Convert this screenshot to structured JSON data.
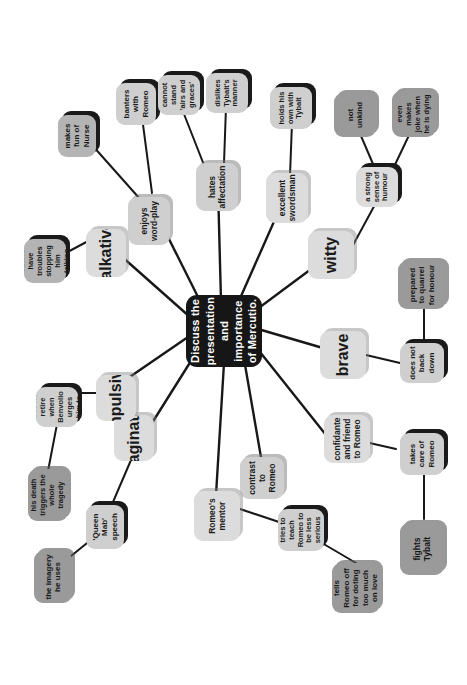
{
  "canvas": {
    "width": 467,
    "height": 685,
    "background": "#ffffff"
  },
  "map": {
    "title": "Mercutio mind map",
    "rotation_degrees": -90,
    "center": {
      "label": "Discuss the presentation and importance of Mercutio.",
      "background": "#161616",
      "text_color": "#ffffff"
    },
    "palette": {
      "dark": "#9a9a9a",
      "mid": "#b4b4b4",
      "light": "#cfcfcf",
      "pale": "#dcdcdc",
      "edge": "#181818",
      "center": "#161616"
    },
    "nodes": [
      {
        "id": "imaginative",
        "label": "imaginative",
        "tone": "pale",
        "level": 1
      },
      {
        "id": "queen-mab",
        "label": "'Queen Mab' speech",
        "tone": "light",
        "level": 2
      },
      {
        "id": "imagery",
        "label": "the imagery he uses",
        "tone": "dark",
        "level": 3
      },
      {
        "id": "impulsive",
        "label": "impulsive",
        "tone": "pale",
        "level": 1
      },
      {
        "id": "does-not-retire",
        "label": "does not retire when Benvolio urges him to",
        "tone": "light",
        "level": 2
      },
      {
        "id": "his-death",
        "label": "his death triggers the whole tragedy",
        "tone": "dark",
        "level": 3
      },
      {
        "id": "talkative",
        "label": "talkative",
        "tone": "pale",
        "level": 1
      },
      {
        "id": "others-have",
        "label": "others have troubles stopping him talking",
        "tone": "mid",
        "level": 2
      },
      {
        "id": "enjoys-word-play",
        "label": "enjoys word-play",
        "tone": "light",
        "level": 1
      },
      {
        "id": "makes-fun-nurse",
        "label": "makes fun of Nurse",
        "tone": "mid",
        "level": 2
      },
      {
        "id": "banters-romeo",
        "label": "banters with Romeo",
        "tone": "light",
        "level": 2
      },
      {
        "id": "hates-affectation",
        "label": "hates affectation",
        "tone": "light",
        "level": 1
      },
      {
        "id": "cannot-stand",
        "label": "cannot stand 'airs and graces'",
        "tone": "light",
        "level": 2
      },
      {
        "id": "dislikes-tybalt",
        "label": "dislikes Tybalt's manner",
        "tone": "light",
        "level": 2
      },
      {
        "id": "excellent-swordsman",
        "label": "excellent swordsman",
        "tone": "pale",
        "level": 1
      },
      {
        "id": "holds-his-own",
        "label": "holds his own with Tybalt",
        "tone": "light",
        "level": 2
      },
      {
        "id": "witty",
        "label": "witty",
        "tone": "pale",
        "level": 1
      },
      {
        "id": "strong-humour",
        "label": "a strong sense of humour",
        "tone": "pale",
        "level": 2
      },
      {
        "id": "not-unkind",
        "label": "not unkind",
        "tone": "dark",
        "level": 3
      },
      {
        "id": "even-makes-joke",
        "label": "even makes joke when he is dying",
        "tone": "dark",
        "level": 3
      },
      {
        "id": "brave",
        "label": "brave",
        "tone": "pale",
        "level": 1
      },
      {
        "id": "does-not-back-down",
        "label": "does not back down",
        "tone": "light",
        "level": 2
      },
      {
        "id": "prepared-quarrel",
        "label": "prepared to quarrel for honour",
        "tone": "dark",
        "level": 3
      },
      {
        "id": "confidante",
        "label": "confidante and friend to Romeo",
        "tone": "pale",
        "level": 1
      },
      {
        "id": "takes-care",
        "label": "takes care of Romeo",
        "tone": "light",
        "level": 2
      },
      {
        "id": "fights-tybalt",
        "label": "fights Tybalt",
        "tone": "dark",
        "level": 3
      },
      {
        "id": "contrast-romeo",
        "label": "contrast to Romeo",
        "tone": "light",
        "level": 1
      },
      {
        "id": "romeos-mentor",
        "label": "Romeo's mentor",
        "tone": "pale",
        "level": 1
      },
      {
        "id": "tries-to-teach",
        "label": "tries to teach Romeo to be less serious",
        "tone": "light",
        "level": 2
      },
      {
        "id": "tells-romeo-off",
        "label": "tells Romeo off for doting too much on love",
        "tone": "dark",
        "level": 3
      }
    ]
  }
}
